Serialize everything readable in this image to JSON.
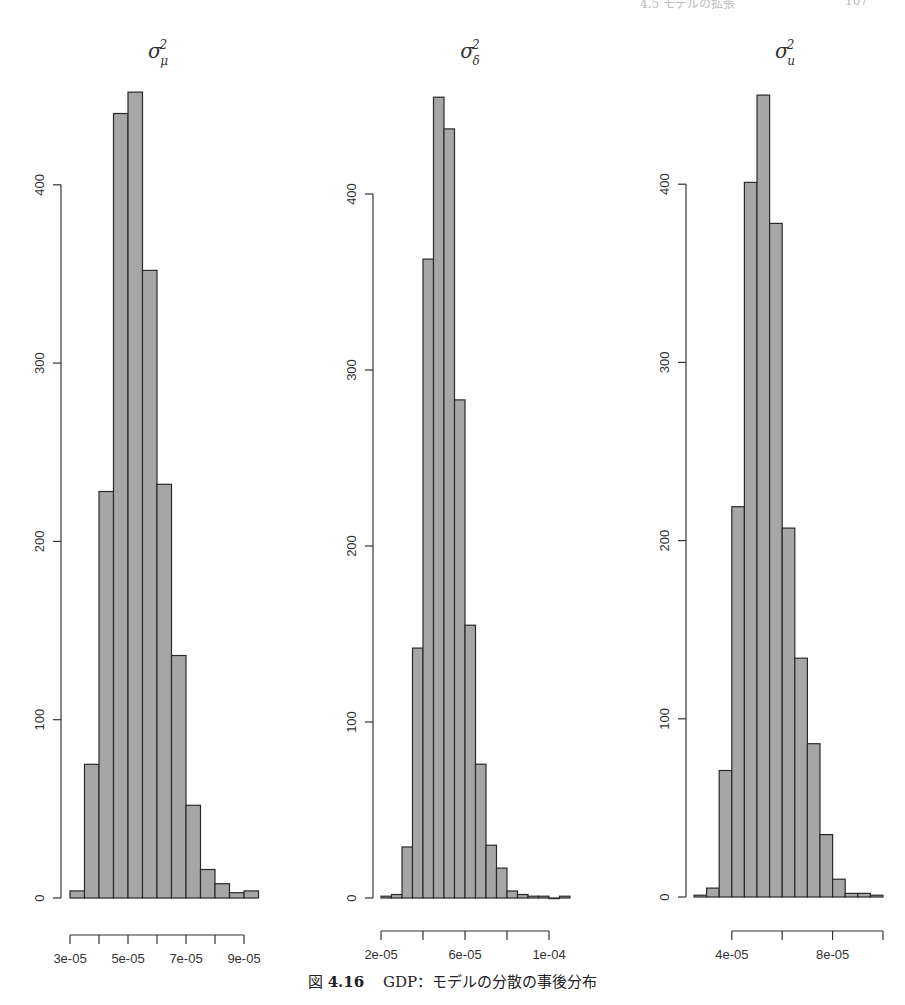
{
  "page_header": {
    "running_title": "4.5 モデルの拡張",
    "page_number": "107"
  },
  "caption": {
    "label": "図",
    "number": "4.16",
    "text": "GDP：モデルの分散の事後分布"
  },
  "style": {
    "bar_fill": "#a6a6a6",
    "bar_stroke": "#2a2a2a",
    "axis_color": "#333333",
    "text_color": "#333333"
  },
  "chart_data": [
    {
      "type": "bar",
      "subtype": "histogram",
      "title": "σ²_μ",
      "title_base": "σ",
      "title_sup": "2",
      "title_sub": "μ",
      "xlabel": "",
      "ylabel": "",
      "bin_start": 3e-05,
      "bin_width": 5e-06,
      "values": [
        4,
        75,
        228,
        440,
        452,
        352,
        232,
        136,
        52,
        16,
        8,
        3,
        4
      ],
      "x_ticks": [
        3e-05,
        4e-05,
        5e-05,
        6e-05,
        7e-05,
        8e-05,
        9e-05
      ],
      "x_tick_labels": [
        "3e-05",
        "",
        "5e-05",
        "",
        "7e-05",
        "",
        "9e-05"
      ],
      "y_ticks": [
        0,
        100,
        200,
        300,
        400
      ],
      "y_tick_labels": [
        "0",
        "100",
        "200",
        "300",
        "400"
      ],
      "xlim": [
        3e-05,
        9.5e-05
      ],
      "ylim": [
        0,
        452
      ],
      "grid": false,
      "legend": null
    },
    {
      "type": "bar",
      "subtype": "histogram",
      "title": "σ²_δ",
      "title_base": "σ",
      "title_sup": "2",
      "title_sub": "δ",
      "xlabel": "",
      "ylabel": "",
      "bin_start": 2e-05,
      "bin_width": 5e-06,
      "values": [
        1,
        2,
        29,
        142,
        363,
        455,
        437,
        283,
        155,
        76,
        30,
        17,
        4,
        2,
        1,
        1,
        0,
        1
      ],
      "x_ticks": [
        2e-05,
        4e-05,
        6e-05,
        8e-05,
        0.0001
      ],
      "x_tick_labels": [
        "2e-05",
        "",
        "6e-05",
        "",
        "1e-04"
      ],
      "y_ticks": [
        0,
        100,
        200,
        300,
        400
      ],
      "y_tick_labels": [
        "0",
        "100",
        "200",
        "300",
        "400"
      ],
      "xlim": [
        2e-05,
        0.00011
      ],
      "ylim": [
        0,
        455
      ],
      "grid": false,
      "legend": null
    },
    {
      "type": "bar",
      "subtype": "histogram",
      "title": "σ²_u",
      "title_base": "σ",
      "title_sup": "2",
      "title_sub": "u",
      "xlabel": "",
      "ylabel": "",
      "bin_start": 2.5e-05,
      "bin_width": 5e-06,
      "values": [
        1,
        5,
        71,
        219,
        401,
        450,
        378,
        207,
        134,
        86,
        35,
        10,
        2,
        2,
        1
      ],
      "x_ticks": [
        4e-05,
        6e-05,
        8e-05,
        0.0001
      ],
      "x_tick_labels": [
        "4e-05",
        "",
        "8e-05",
        ""
      ],
      "y_ticks": [
        0,
        100,
        200,
        300,
        400
      ],
      "y_tick_labels": [
        "0",
        "100",
        "200",
        "300",
        "400"
      ],
      "xlim": [
        2.5e-05,
        0.0001
      ],
      "ylim": [
        0,
        450
      ],
      "grid": false,
      "legend": null
    }
  ]
}
